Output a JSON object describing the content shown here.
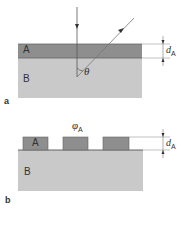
{
  "colors": {
    "layer_a": "#8e8e8e",
    "substrate_b": "#c9c9c9",
    "line": "#555555",
    "text": "#333333"
  },
  "panel_a": {
    "label": "a",
    "layer_label": "A",
    "substrate_label": "B",
    "angle_label": "θ",
    "thickness_label": "d",
    "thickness_subscript": "A"
  },
  "panel_b": {
    "label": "b",
    "block_label": "A",
    "substrate_label": "B",
    "fraction_label": "φ",
    "fraction_subscript": "A",
    "thickness_label": "d",
    "thickness_subscript": "A",
    "block_count": 3
  }
}
